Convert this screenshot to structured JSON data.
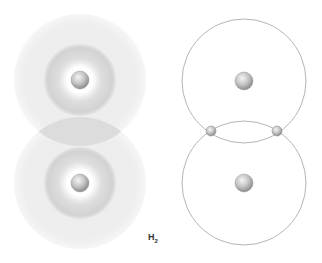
{
  "diagram": {
    "title": "H",
    "subscript": "2",
    "cloud_model": {
      "atoms": [
        {
          "name": "hydrogen-atom-top",
          "cx": 80,
          "cy": 80
        },
        {
          "name": "hydrogen-atom-bottom",
          "cx": 80,
          "cy": 183
        }
      ],
      "outer_radius": 66,
      "inner_radius": 36
    },
    "orbit_model": {
      "atoms": [
        {
          "name": "hydrogen-atom-top",
          "cx": 244,
          "cy": 81
        },
        {
          "name": "hydrogen-atom-bottom",
          "cx": 244,
          "cy": 183
        }
      ],
      "orbit_radius": 62,
      "electrons": [
        {
          "name": "shared-electron-left",
          "cx": 210,
          "cy": 131
        },
        {
          "name": "shared-electron-right",
          "cx": 278,
          "cy": 131
        }
      ]
    },
    "colors": {
      "orbit_line": "#b5b5b5",
      "cloud_outer": "#efefef",
      "cloud_inner": "#d4d4d4",
      "nucleus": "#bdbdbd"
    }
  }
}
